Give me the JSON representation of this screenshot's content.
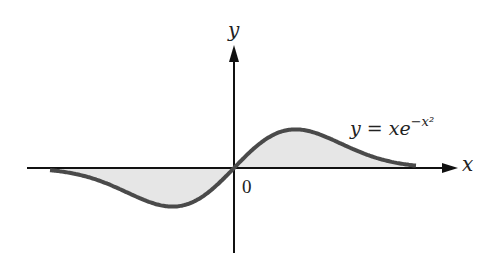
{
  "chart_data": {
    "type": "line",
    "title": "",
    "function": "y = xe^{-x^2}",
    "xlabel": "x",
    "ylabel": "y",
    "origin_label": "0",
    "annotation": {
      "text_main": "y = xe",
      "text_sup": "−x²"
    },
    "x": [
      -3.0,
      -2.5,
      -2.0,
      -1.5,
      -1.0,
      -0.7071,
      -0.5,
      0,
      0.5,
      0.7071,
      1.0,
      1.5,
      2.0,
      2.5,
      3.0
    ],
    "series": [
      {
        "name": "y = xe^{-x^2}",
        "values": [
          -0.0004,
          -0.0048,
          -0.0366,
          -0.1581,
          -0.3679,
          -0.4289,
          -0.3894,
          0,
          0.3894,
          0.4289,
          0.3679,
          0.1581,
          0.0366,
          0.0048,
          0.0004
        ]
      }
    ],
    "shaded_region": "between curve and x-axis",
    "grid": false,
    "legend": "none",
    "colors": {
      "curve": "#4a4a4a",
      "fill": "#e6e6e6",
      "axes": "#111111"
    }
  },
  "labels": {
    "x": "x",
    "y": "y",
    "origin": "0",
    "eq_main": "y = xe",
    "eq_sup": "−x²"
  }
}
